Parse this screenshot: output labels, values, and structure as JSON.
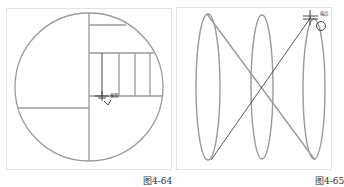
{
  "figures": [
    {
      "id": "left",
      "caption": "图4-64",
      "cursor_label": "象限",
      "shapes": {
        "circle": {
          "cx": 89,
          "cy": 87,
          "r": 74
        },
        "hatch_count": 4
      }
    },
    {
      "id": "right",
      "caption": "图4-65",
      "cursor_label": "端点",
      "shapes": {
        "ellipses": 3,
        "lines": 2
      }
    }
  ],
  "colors": {
    "stroke_gray": "#9a9a9a",
    "stroke_dark": "#444444",
    "frame": "#e2e2e2"
  }
}
